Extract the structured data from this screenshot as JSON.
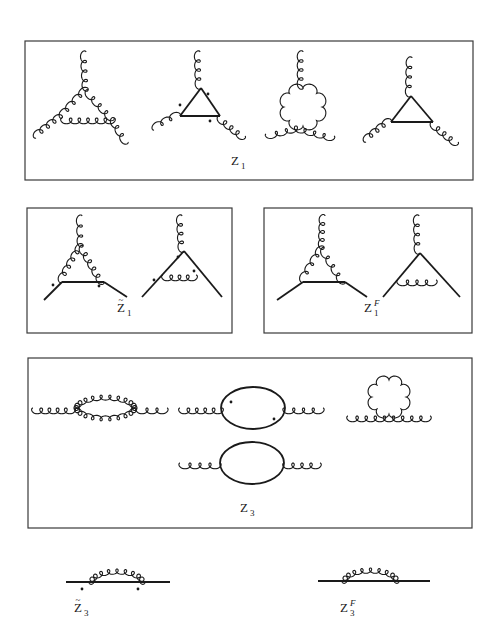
{
  "figure": {
    "colors": {
      "ink": "#1a1a1a",
      "frame": "#3a3a3a",
      "background": "#ffffff"
    }
  },
  "boxes": [
    {
      "id": "Z1-box",
      "x": 25,
      "y": 41,
      "w": 448,
      "h": 139
    },
    {
      "id": "Z1tilde-box",
      "x": 27,
      "y": 208,
      "w": 205,
      "h": 125
    },
    {
      "id": "Z1F-box",
      "x": 264,
      "y": 208,
      "w": 208,
      "h": 125
    },
    {
      "id": "Z3-box",
      "x": 28,
      "y": 358,
      "w": 444,
      "h": 170
    }
  ],
  "labels": [
    {
      "id": "label-Z1",
      "base": "Z",
      "sub": "1",
      "sup": "",
      "tilde": false,
      "x": 231,
      "y": 165
    },
    {
      "id": "label-Z1-tilde",
      "base": "Z",
      "sub": "1",
      "sup": "",
      "tilde": true,
      "x": 117,
      "y": 312
    },
    {
      "id": "label-Z1-F",
      "base": "Z",
      "sub": "1",
      "sup": "F",
      "tilde": false,
      "x": 364,
      "y": 312
    },
    {
      "id": "label-Z3",
      "base": "Z",
      "sub": "3",
      "sup": "",
      "tilde": false,
      "x": 240,
      "y": 512
    },
    {
      "id": "label-Z3-tilde",
      "base": "Z",
      "sub": "3",
      "sup": "",
      "tilde": true,
      "x": 74,
      "y": 612
    },
    {
      "id": "label-Z3-F",
      "base": "Z",
      "sub": "3",
      "sup": "F",
      "tilde": false,
      "x": 340,
      "y": 612
    }
  ],
  "diagrams": [
    {
      "id": "Z1-three-gluon-loop",
      "gluons": [
        [
          86,
          52,
          88,
          90
        ],
        [
          88,
          90,
          62,
          118
        ],
        [
          88,
          90,
          114,
          118
        ],
        [
          62,
          118,
          114,
          118
        ],
        [
          62,
          118,
          36,
          138
        ],
        [
          114,
          118,
          128,
          142
        ]
      ],
      "fermions": [],
      "dots": [],
      "loops": []
    },
    {
      "id": "Z1-ghost-triangle",
      "gluons": [
        [
          200,
          52,
          201,
          88
        ],
        [
          180,
          116,
          154,
          130
        ],
        [
          220,
          116,
          245,
          136
        ]
      ],
      "fermions": [
        [
          201,
          88,
          180,
          116
        ],
        [
          180,
          116,
          220,
          116
        ],
        [
          220,
          116,
          201,
          88
        ]
      ],
      "dots": [
        [
          208,
          94
        ],
        [
          180,
          105
        ],
        [
          210,
          121
        ]
      ],
      "loops": []
    },
    {
      "id": "Z1-four-gluon-tadpole",
      "gluons": [
        [
          303,
          52,
          303,
          88
        ],
        [
          266,
          134,
          296,
          126
        ],
        [
          296,
          126,
          334,
          136
        ]
      ],
      "fermions": [],
      "dots": [],
      "loops": [
        {
          "cx": 303,
          "cy": 107,
          "r": 19,
          "type": "gluon"
        }
      ]
    },
    {
      "id": "Z1-fermion-triangle",
      "gluons": [
        [
          412,
          58,
          411,
          96
        ],
        [
          391,
          122,
          366,
          142
        ],
        [
          433,
          122,
          458,
          142
        ]
      ],
      "fermions": [
        [
          411,
          96,
          391,
          122
        ],
        [
          391,
          122,
          433,
          122
        ],
        [
          433,
          122,
          411,
          96
        ]
      ],
      "dots": [],
      "loops": []
    },
    {
      "id": "Z1tilde-gluon-exchange",
      "gluons": [
        [
          82,
          216,
          83,
          246
        ],
        [
          83,
          246,
          62,
          282
        ],
        [
          83,
          246,
          104,
          282
        ]
      ],
      "fermions": [
        [
          44,
          300,
          62,
          282
        ],
        [
          62,
          282,
          104,
          282
        ],
        [
          104,
          282,
          127,
          297
        ]
      ],
      "dots": [
        [
          53,
          285
        ],
        [
          99,
          286
        ]
      ],
      "loops": []
    },
    {
      "id": "Z1tilde-ghost-vertex",
      "gluons": [
        [
          182,
          216,
          184,
          251
        ],
        [
          163,
          275,
          196,
          275
        ]
      ],
      "fermions": [
        [
          142,
          297,
          184,
          251
        ],
        [
          184,
          251,
          222,
          297
        ]
      ],
      "dots": [
        [
          178,
          257
        ],
        [
          154,
          280
        ],
        [
          194,
          271
        ]
      ],
      "loops": []
    },
    {
      "id": "Z1F-gluon-triangle",
      "gluons": [
        [
          325,
          216,
          324,
          248
        ],
        [
          324,
          248,
          303,
          282
        ],
        [
          324,
          248,
          345,
          282
        ]
      ],
      "fermions": [
        [
          277,
          300,
          303,
          282
        ],
        [
          303,
          282,
          345,
          282
        ],
        [
          345,
          282,
          367,
          297
        ]
      ],
      "dots": [],
      "loops": []
    },
    {
      "id": "Z1F-fermion-vertex",
      "gluons": [
        [
          419,
          216,
          420,
          253
        ],
        [
          398,
          280,
          436,
          280
        ]
      ],
      "fermions": [
        [
          383,
          297,
          420,
          253
        ],
        [
          420,
          253,
          460,
          297
        ]
      ],
      "dots": [],
      "loops": []
    },
    {
      "id": "Z3-gluon-bubble",
      "gluons": [
        [
          33,
          408,
          74,
          408
        ],
        [
          137,
          408,
          167,
          408
        ],
        [
          74,
          408,
          137,
          408,
          "arc-up"
        ],
        [
          74,
          408,
          137,
          408,
          "arc-down"
        ]
      ],
      "fermions": [],
      "dots": [],
      "loops": []
    },
    {
      "id": "Z3-ghost-bubble",
      "gluons": [
        [
          180,
          408,
          222,
          408
        ],
        [
          284,
          408,
          323,
          408
        ]
      ],
      "fermions": [],
      "ellipses": [
        {
          "cx": 253,
          "cy": 408,
          "rx": 32,
          "ry": 21
        }
      ],
      "dots": [
        [
          231,
          402
        ],
        [
          274,
          419
        ]
      ],
      "loops": []
    },
    {
      "id": "Z3-gluon-tadpole",
      "gluons": [
        [
          348,
          416,
          430,
          416
        ]
      ],
      "fermions": [],
      "dots": [],
      "loops": [
        {
          "cx": 389,
          "cy": 397,
          "r": 17,
          "type": "gluon"
        }
      ]
    },
    {
      "id": "Z3-quark-bubble",
      "gluons": [
        [
          180,
          463,
          220,
          463
        ],
        [
          284,
          463,
          320,
          463
        ]
      ],
      "fermions": [],
      "ellipses": [
        {
          "cx": 252,
          "cy": 463,
          "rx": 32,
          "ry": 21
        }
      ],
      "dots": [],
      "loops": []
    },
    {
      "id": "Z3tilde-ghost-self-energy",
      "gluons": [
        [
          89,
          582,
          145,
          582,
          "arc-up"
        ]
      ],
      "fermions": [
        [
          66,
          582,
          170,
          582
        ]
      ],
      "dots": [
        [
          82,
          589
        ],
        [
          138,
          589
        ]
      ],
      "loops": []
    },
    {
      "id": "Z3F-quark-self-energy",
      "gluons": [
        [
          342,
          581,
          399,
          581,
          "arc-up"
        ]
      ],
      "fermions": [
        [
          318,
          581,
          430,
          581
        ]
      ],
      "dots": [],
      "loops": []
    }
  ]
}
